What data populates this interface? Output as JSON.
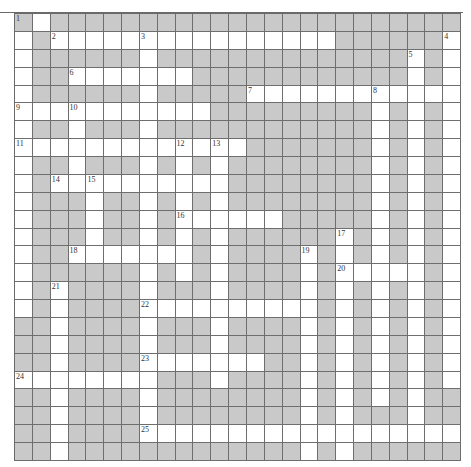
{
  "puzzle": {
    "rows": 25,
    "cols": 25,
    "colors": {
      "block": "#c9c9c9",
      "open": "#ffffff",
      "line": "#6e6e6e"
    },
    "grid": [
      "#.#######################",
      ".#................######.",
      ".######.##############.#.",
      ".##.......############.#.",
      ".######.#####............",
      "...........#########.#.#.",
      ".##.###.############.#.#.",
      ".............#######.#.#.",
      ".##.###.#.#.########.#.#.",
      ".#..........########.#.#.",
      ".###.##.#.#.########.#.#.",
      ".###.##.#......#####.#.#.",
      ".###.##.#.#.######.#.#.#.",
      ".##.......#.####.#.#.#.#.",
      ".######.#.#.####.#.....#.",
      ".#.####.###.####.#.#.#.#.",
      ".#.####..........#.#.#.#.",
      "##.####.###.####.#.#.#.#.",
      "##.####.###.####.#.#.#.#.",
      "##.####.......##.#.#.#.#.",
      "........###.####.#.#.#.#.",
      "##.####.########.#.#.#.##",
      "##.####.########.#.###.##",
      "##.####..................",
      "##.#############.#.######"
    ],
    "numbers": [
      {
        "n": "1",
        "r": 0,
        "c": 0
      },
      {
        "n": "2",
        "r": 1,
        "c": 2
      },
      {
        "n": "3",
        "r": 1,
        "c": 7
      },
      {
        "n": "4",
        "r": 1,
        "c": 24
      },
      {
        "n": "5",
        "r": 2,
        "c": 22
      },
      {
        "n": "6",
        "r": 3,
        "c": 3
      },
      {
        "n": "7",
        "r": 4,
        "c": 13
      },
      {
        "n": "8",
        "r": 4,
        "c": 20
      },
      {
        "n": "9",
        "r": 5,
        "c": 0
      },
      {
        "n": "10",
        "r": 5,
        "c": 3
      },
      {
        "n": "11",
        "r": 7,
        "c": 0
      },
      {
        "n": "12",
        "r": 7,
        "c": 9
      },
      {
        "n": "13",
        "r": 7,
        "c": 11
      },
      {
        "n": "14",
        "r": 9,
        "c": 2
      },
      {
        "n": "15",
        "r": 9,
        "c": 4
      },
      {
        "n": "16",
        "r": 11,
        "c": 9
      },
      {
        "n": "17",
        "r": 12,
        "c": 18
      },
      {
        "n": "18",
        "r": 13,
        "c": 3
      },
      {
        "n": "19",
        "r": 13,
        "c": 16
      },
      {
        "n": "20",
        "r": 14,
        "c": 18
      },
      {
        "n": "21",
        "r": 15,
        "c": 2
      },
      {
        "n": "22",
        "r": 16,
        "c": 7
      },
      {
        "n": "23",
        "r": 19,
        "c": 7
      },
      {
        "n": "24",
        "r": 20,
        "c": 0
      },
      {
        "n": "25",
        "r": 23,
        "c": 7
      }
    ]
  }
}
